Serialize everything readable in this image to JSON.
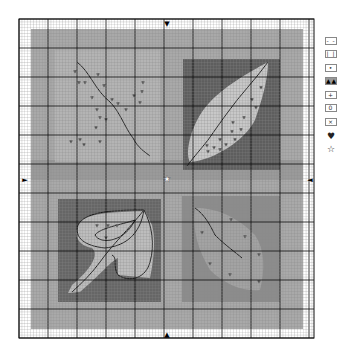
{
  "pattern": {
    "title": "Autumn Leaves Cross-Stitch Chart",
    "grid": {
      "left": 19,
      "top": 19,
      "right": 314,
      "bottom": 338,
      "cell": 2.9,
      "major_every": 10
    },
    "colors": {
      "paper": "#ffffff",
      "grid_minor": "#8a8a8a",
      "grid_major": "#111111",
      "outer_bg": "#a9a9a9",
      "band": "#9a9a9a",
      "tl_panel": "#b4b4b4",
      "tr_panel": "#5e5e5e",
      "tr_leaf": "#c8c8c8",
      "bl_panel": "#666666",
      "bl_leaf": "#bdbdbd",
      "br_panel": "#8c8c8c",
      "br_leaf": "#a3a3a3",
      "backstitch": "#111111",
      "heart": "#555555"
    },
    "center_marker": "star-icon",
    "arrows": {
      "top": "▼",
      "bottom": "▲",
      "left": "►",
      "right": "◄"
    }
  },
  "legend": {
    "items": [
      {
        "symbol": "- -",
        "style": "light"
      },
      {
        "symbol": "| |",
        "style": "light"
      },
      {
        "symbol": "• •",
        "style": "light"
      },
      {
        "symbol": "▲▲",
        "style": "dark"
      },
      {
        "symbol": "+ +",
        "style": "light"
      },
      {
        "symbol": "0 0",
        "style": "light"
      },
      {
        "symbol": "× ×",
        "style": "light"
      },
      {
        "symbol": "♥",
        "style": "glyph"
      },
      {
        "symbol": "☆",
        "style": "glyph"
      }
    ]
  }
}
